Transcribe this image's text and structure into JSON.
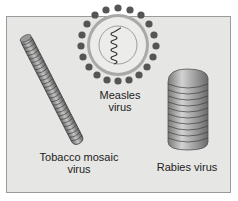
{
  "figure": {
    "background": "#e6e6e4",
    "border_color": "#9a9a9a",
    "viruses": [
      {
        "id": "tobacco-mosaic",
        "label_line1": "Tobacco mosaic",
        "label_line2": "virus",
        "shape": "helical rod"
      },
      {
        "id": "measles",
        "label_line1": "Measles",
        "label_line2": "virus",
        "shape": "enveloped sphere with spikes and helical nucleocapsid"
      },
      {
        "id": "rabies",
        "label_line1": "Rabies virus",
        "shape": "bullet-shaped helical"
      }
    ]
  }
}
